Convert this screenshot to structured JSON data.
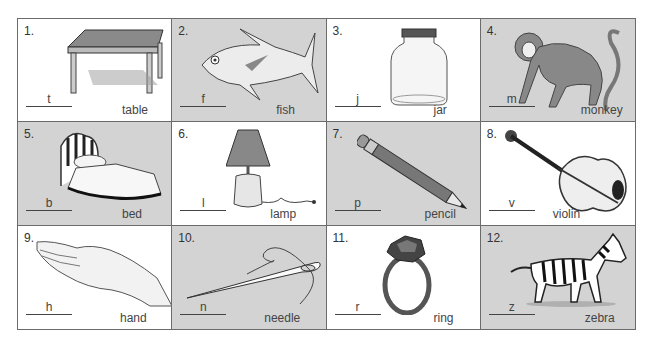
{
  "worksheet": {
    "items": [
      {
        "number": "1.",
        "letter": "t",
        "word": "table",
        "icon": "table-icon",
        "shade": "white"
      },
      {
        "number": "2.",
        "letter": "f",
        "word": "fish",
        "icon": "fish-icon",
        "shade": "gray"
      },
      {
        "number": "3.",
        "letter": "j",
        "word": "jar",
        "icon": "jar-icon",
        "shade": "white"
      },
      {
        "number": "4.",
        "letter": "m",
        "word": "monkey",
        "icon": "monkey-icon",
        "shade": "gray"
      },
      {
        "number": "5.",
        "letter": "b",
        "word": "bed",
        "icon": "bed-icon",
        "shade": "gray"
      },
      {
        "number": "6.",
        "letter": "l",
        "word": "lamp",
        "icon": "lamp-icon",
        "shade": "white"
      },
      {
        "number": "7.",
        "letter": "p",
        "word": "pencil",
        "icon": "pencil-icon",
        "shade": "gray"
      },
      {
        "number": "8.",
        "letter": "v",
        "word": "violin",
        "icon": "violin-icon",
        "shade": "white"
      },
      {
        "number": "9.",
        "letter": "h",
        "word": "hand",
        "icon": "hand-icon",
        "shade": "white"
      },
      {
        "number": "10.",
        "letter": "n",
        "word": "needle",
        "icon": "needle-icon",
        "shade": "gray"
      },
      {
        "number": "11.",
        "letter": "r",
        "word": "ring",
        "icon": "ring-icon",
        "shade": "white"
      },
      {
        "number": "12.",
        "letter": "z",
        "word": "zebra",
        "icon": "zebra-icon",
        "shade": "gray"
      }
    ]
  }
}
